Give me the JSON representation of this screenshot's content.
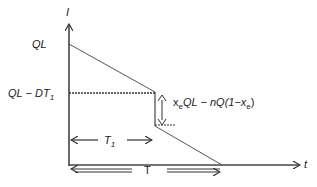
{
  "diagram": {
    "type": "inventory-level-vs-time",
    "axes": {
      "y_label": "I",
      "x_label": "t"
    },
    "y_ticks": {
      "top": "QL",
      "mid_main": "QL − DT",
      "mid_sub": "1"
    },
    "jump_label": {
      "x": "x",
      "x_sub": "e",
      "mid": "QL − ",
      "n": "n",
      "tail": "Q(1−x",
      "tail_sub": "e",
      "close": ")"
    },
    "intervals": {
      "t1_main": "T",
      "t1_sub": "1",
      "total": "T"
    },
    "colors": {
      "line": "#444444",
      "text": "#222222",
      "background": "#ffffff"
    }
  }
}
